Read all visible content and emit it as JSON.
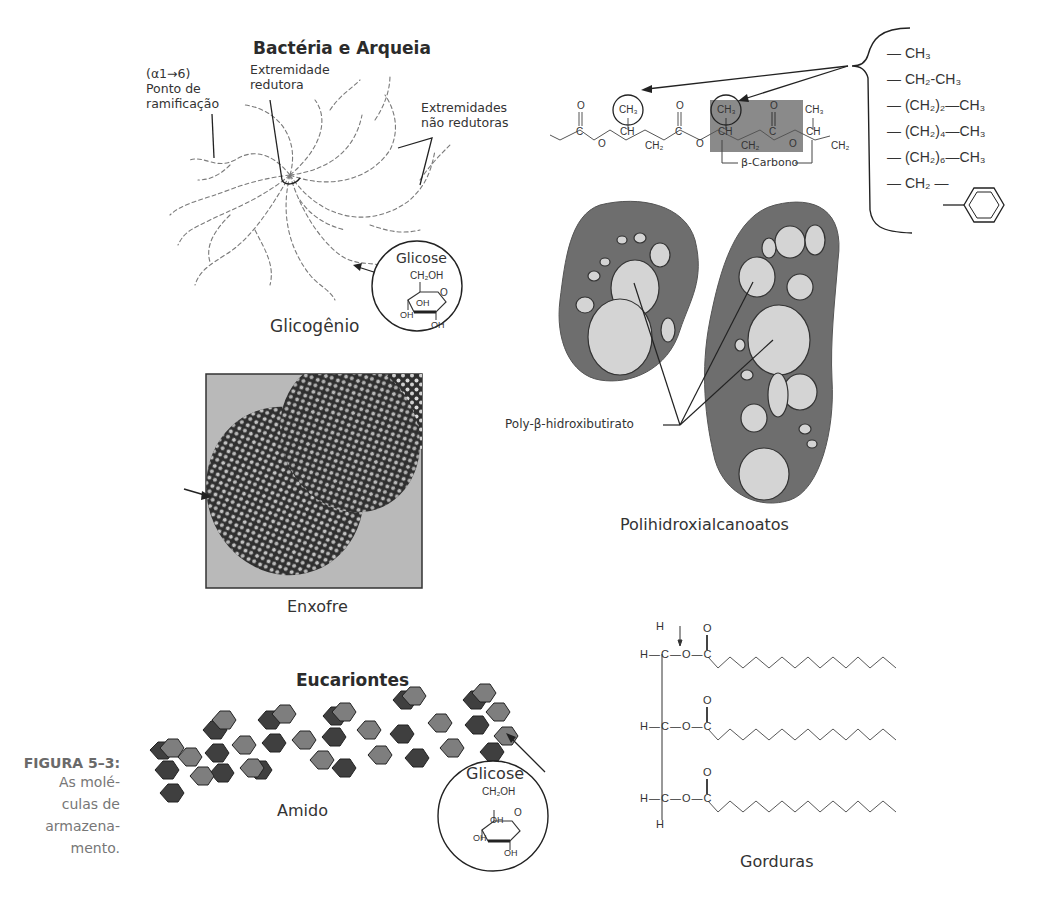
{
  "figure": {
    "number": "FIGURA 5–3:",
    "caption_lines": [
      "As molé-",
      "culas de",
      "armazena-",
      "mento."
    ]
  },
  "sections": {
    "prokaryotes_title": "Bactéria e Arqueia",
    "eukaryotes_title": "Eucariontes"
  },
  "glycogen": {
    "label": "Glicogênio",
    "branch_point": [
      "(α1→6)",
      "Ponto de",
      "ramificação"
    ],
    "reducing_end": [
      "Extremidade",
      "redutora"
    ],
    "nonreducing_ends": [
      "Extremidades",
      "não redutoras"
    ],
    "glucose_inset": {
      "title": "Glicose",
      "ch2oh": "CH₂OH",
      "ring_o": "O",
      "oh_labels": [
        "OH",
        "OH",
        "OH"
      ]
    }
  },
  "pha": {
    "label": "Polihidroxialcanoatos",
    "granule_label": "Poly-β-hidroxibutirato",
    "beta_carbon_label": "β-Carbono",
    "backbone_atoms": [
      "O",
      "C",
      "O",
      "CH",
      "CH₂",
      "O",
      "C",
      "O",
      "CH",
      "CH₂",
      "O",
      "C",
      "O",
      "CH",
      "CH₂"
    ],
    "methyl": "CH₃",
    "substituents": [
      "— CH₃",
      "— CH₂-CH₃",
      "— (CH₂)₂—CH₃",
      "— (CH₂)₄—CH₃",
      "— (CH₂)₆—CH₃",
      "— CH₂ —"
    ]
  },
  "sulfur": {
    "label": "Enxofre"
  },
  "starch": {
    "label": "Amido",
    "glucose_inset": {
      "title": "Glicose",
      "ch2oh": "CH₂OH",
      "ring_o": "O",
      "oh_labels": [
        "OH",
        "OH",
        "OH"
      ]
    }
  },
  "fats": {
    "label": "Gorduras",
    "glycerol_rows": [
      "H—C—O—C",
      "H—C—O—C",
      "H—C—O—C"
    ],
    "top_h": "H",
    "bottom_h": "H",
    "carbonyl_o": "O"
  },
  "colors": {
    "dark_hex": "#3f3f3f",
    "light_hex": "#7e7e7e",
    "cell_wall": "#6e6e6e",
    "granule": "#d4d4d4",
    "sulfur_bg": "#b9b9b9",
    "sulfur_cell": "#2f2f2f",
    "beta_box": "#8a8a8a"
  }
}
